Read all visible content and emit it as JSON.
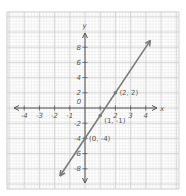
{
  "chart_data": {
    "type": "line",
    "title": "",
    "xlabel": "x",
    "ylabel": "y",
    "xlim": [
      -4.5,
      4.5
    ],
    "ylim": [
      -9,
      9
    ],
    "grid": true,
    "x_ticks": [
      -4,
      -3,
      -2,
      -1,
      0,
      1,
      2,
      3,
      4
    ],
    "x_tick_labels": [
      "-4",
      "-3",
      "-2",
      "-1",
      "0",
      "2",
      "3",
      "4"
    ],
    "y_ticks": [
      -8,
      -6,
      -4,
      -2,
      2,
      4,
      6,
      8
    ],
    "y_tick_labels": [
      "8",
      "6",
      "4",
      "2",
      "-2",
      "-4",
      "-6",
      "-8"
    ],
    "series": [
      {
        "name": "y = 3x - 4",
        "equation": "y = 3x - 4",
        "slope": 3,
        "intercept": -4,
        "x": [
          -1.65,
          4.3
        ],
        "y": [
          -8.95,
          8.9
        ],
        "color": "#7a7a7a"
      }
    ],
    "points": [
      {
        "x": 2,
        "y": 2,
        "label": "(2, 2)"
      },
      {
        "x": 1,
        "y": -1,
        "label": "(1, -1)"
      },
      {
        "x": 0,
        "y": -4,
        "label": "(0, -4)"
      }
    ]
  },
  "axes": {
    "x_axis_label": "x",
    "y_axis_label": "y",
    "origin_label": "0"
  },
  "colors": {
    "grid_minor": "#e6e6e6",
    "grid_major": "#c8c8c8",
    "axis": "#555555",
    "line": "#7a7a7a",
    "background": "#ffffff"
  }
}
